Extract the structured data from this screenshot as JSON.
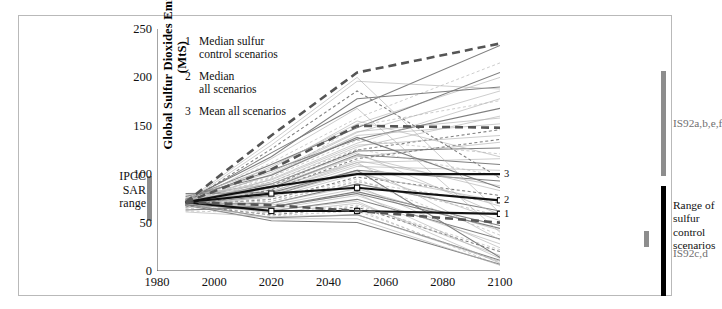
{
  "figure": {
    "axis_title_y": "Global Sulfur Dioxides Emissions\n(MtS)"
  },
  "legend": {
    "items": [
      {
        "num": "1",
        "label": "Median sulfur\ncontrol scenarios"
      },
      {
        "num": "2",
        "label": "Median\nall scenarios"
      },
      {
        "num": "3",
        "label": "Mean all scenarios"
      }
    ]
  },
  "annotations": {
    "sar_range": "IPCC\nSAR\nrange",
    "is92abef": "IS92a,b,e,f",
    "range_sulfur": "Range of\nsulfur\ncontrol\nscenarios",
    "is92cd": "IS92c,d",
    "mark1": "1",
    "mark2": "2",
    "mark3": "3"
  },
  "colors": {
    "grey_bar": "#8d8d8d",
    "black_bar": "#000000",
    "frame": "#b9b9b9",
    "axis": "#4a4a4a",
    "scenario_light": "#b0b0b0",
    "scenario_mid": "#787878",
    "highlight": "#111111"
  },
  "chart_data": {
    "type": "line",
    "title": "",
    "xlabel": "",
    "ylabel": "Global Sulfur Dioxides Emissions (MtS)",
    "xlim": [
      1980,
      2100
    ],
    "ylim": [
      0,
      250
    ],
    "xticks": [
      1980,
      2000,
      2020,
      2040,
      2060,
      2080,
      2100
    ],
    "yticks": [
      0,
      50,
      100,
      150,
      200,
      250
    ],
    "grid": false,
    "legend_position": "inside-top-left",
    "ipcc_sar_range": {
      "x": 1990,
      "ymin": 50,
      "ymax": 97
    },
    "right_bars": [
      {
        "name": "IS92a,b,e,f",
        "x": 2100,
        "ymin": 107,
        "ymax": 215,
        "color": "#8d8d8d"
      },
      {
        "name": "Range of sulfur control scenarios",
        "x": 2100,
        "ymin": 5,
        "ymax": 118,
        "color": "#000000"
      },
      {
        "name": "IS92c,d",
        "x": 2095,
        "ymin": 50,
        "ymax": 67,
        "color": "#8d8d8d"
      }
    ],
    "x": [
      1990,
      2020,
      2050,
      2100
    ],
    "highlighted_series": [
      {
        "name": "Mean all scenarios",
        "marker_num": "3",
        "style": "solid-thick",
        "values": [
          71,
          87,
          100,
          100
        ]
      },
      {
        "name": "Median all scenarios",
        "marker_num": "2",
        "style": "solid-thick-marker",
        "values": [
          71,
          80,
          86,
          73
        ]
      },
      {
        "name": "Median sulfur control scenarios",
        "marker_num": "1",
        "style": "solid-thick-marker",
        "values": [
          71,
          62,
          62,
          59
        ]
      },
      {
        "name": "Upper dashed envelope",
        "marker_num": "",
        "style": "dashed-thick",
        "values": [
          71,
          140,
          205,
          235
        ]
      },
      {
        "name": "Mid dashed envelope",
        "marker_num": "",
        "style": "dashed-thick",
        "values": [
          71,
          105,
          150,
          148
        ]
      },
      {
        "name": "Lower dashed envelope",
        "marker_num": "",
        "style": "dashed-thick",
        "values": [
          71,
          68,
          62,
          50
        ]
      }
    ],
    "series": [
      {
        "name": "s01",
        "values": [
          71,
          122,
          170,
          233
        ]
      },
      {
        "name": "s02",
        "values": [
          72,
          112,
          158,
          215
        ]
      },
      {
        "name": "s03",
        "values": [
          70,
          108,
          152,
          200
        ]
      },
      {
        "name": "s04",
        "values": [
          73,
          118,
          178,
          190
        ]
      },
      {
        "name": "s05",
        "values": [
          69,
          100,
          143,
          186
        ]
      },
      {
        "name": "s06",
        "values": [
          71,
          96,
          150,
          176
        ]
      },
      {
        "name": "s07",
        "values": [
          74,
          104,
          136,
          168
        ]
      },
      {
        "name": "s08",
        "values": [
          68,
          92,
          128,
          160
        ]
      },
      {
        "name": "s09",
        "values": [
          72,
          99,
          140,
          152
        ]
      },
      {
        "name": "s10",
        "values": [
          70,
          88,
          125,
          146
        ]
      },
      {
        "name": "s11",
        "values": [
          73,
          94,
          130,
          140
        ]
      },
      {
        "name": "s12",
        "values": [
          69,
          86,
          118,
          133
        ]
      },
      {
        "name": "s13",
        "values": [
          71,
          90,
          124,
          127
        ]
      },
      {
        "name": "s14",
        "values": [
          75,
          97,
          135,
          121
        ]
      },
      {
        "name": "s15",
        "values": [
          68,
          82,
          112,
          116
        ]
      },
      {
        "name": "s16",
        "values": [
          72,
          86,
          120,
          110
        ]
      },
      {
        "name": "s17",
        "values": [
          70,
          80,
          108,
          104
        ]
      },
      {
        "name": "s18",
        "values": [
          74,
          92,
          126,
          98
        ]
      },
      {
        "name": "s19",
        "values": [
          69,
          78,
          104,
          93
        ]
      },
      {
        "name": "s20",
        "values": [
          71,
          84,
          114,
          88
        ]
      },
      {
        "name": "s21",
        "values": [
          73,
          88,
          119,
          83
        ]
      },
      {
        "name": "s22",
        "values": [
          68,
          74,
          97,
          78
        ]
      },
      {
        "name": "s23",
        "values": [
          70,
          76,
          100,
          72
        ]
      },
      {
        "name": "s24",
        "values": [
          72,
          82,
          110,
          67
        ]
      },
      {
        "name": "s25",
        "values": [
          69,
          70,
          90,
          62
        ]
      },
      {
        "name": "s26",
        "values": [
          71,
          72,
          93,
          57
        ]
      },
      {
        "name": "s27",
        "values": [
          74,
          80,
          103,
          52
        ]
      },
      {
        "name": "s28",
        "values": [
          68,
          66,
          82,
          47
        ]
      },
      {
        "name": "s29",
        "values": [
          70,
          68,
          85,
          42
        ]
      },
      {
        "name": "s30",
        "values": [
          72,
          74,
          95,
          37
        ]
      },
      {
        "name": "s31",
        "values": [
          69,
          62,
          74,
          33
        ]
      },
      {
        "name": "s32",
        "values": [
          71,
          64,
          78,
          28
        ]
      },
      {
        "name": "s33",
        "values": [
          73,
          70,
          88,
          24
        ]
      },
      {
        "name": "s34",
        "values": [
          68,
          58,
          66,
          20
        ]
      },
      {
        "name": "s35",
        "values": [
          70,
          60,
          70,
          16
        ]
      },
      {
        "name": "s36",
        "values": [
          72,
          66,
          80,
          13
        ]
      },
      {
        "name": "s37",
        "values": [
          69,
          55,
          58,
          11
        ]
      },
      {
        "name": "s38",
        "values": [
          71,
          57,
          62,
          9
        ]
      },
      {
        "name": "s39",
        "values": [
          73,
          63,
          72,
          8
        ]
      },
      {
        "name": "s40",
        "values": [
          68,
          52,
          50,
          7
        ]
      },
      {
        "name": "s41",
        "values": [
          70,
          54,
          54,
          6
        ]
      },
      {
        "name": "s42",
        "values": [
          72,
          60,
          64,
          6
        ]
      },
      {
        "name": "s43",
        "values": [
          74,
          110,
          148,
          205
        ]
      },
      {
        "name": "s44",
        "values": [
          67,
          95,
          132,
          178
        ]
      },
      {
        "name": "s45",
        "values": [
          75,
          102,
          144,
          158
        ]
      },
      {
        "name": "s46",
        "values": [
          66,
          84,
          116,
          136
        ]
      },
      {
        "name": "s47",
        "values": [
          76,
          106,
          155,
          118
        ]
      },
      {
        "name": "s48",
        "values": [
          65,
          78,
          102,
          100
        ]
      },
      {
        "name": "s49",
        "values": [
          77,
          99,
          138,
          86
        ]
      },
      {
        "name": "s50",
        "values": [
          64,
          72,
          92,
          70
        ]
      },
      {
        "name": "s51",
        "values": [
          78,
          90,
          122,
          58
        ]
      },
      {
        "name": "s52",
        "values": [
          63,
          66,
          80,
          44
        ]
      },
      {
        "name": "s53",
        "values": [
          79,
          86,
          112,
          32
        ]
      },
      {
        "name": "s54",
        "values": [
          62,
          60,
          68,
          22
        ]
      },
      {
        "name": "s55",
        "values": [
          80,
          81,
          104,
          14
        ]
      },
      {
        "name": "s56",
        "values": [
          61,
          56,
          58,
          10
        ]
      },
      {
        "name": "s57",
        "values": [
          71,
          130,
          196,
          188
        ]
      },
      {
        "name": "s58",
        "values": [
          70,
          126,
          186,
          96
        ]
      },
      {
        "name": "s59",
        "values": [
          72,
          134,
          200,
          60
        ]
      },
      {
        "name": "s60",
        "values": [
          69,
          116,
          168,
          40
        ]
      }
    ]
  }
}
